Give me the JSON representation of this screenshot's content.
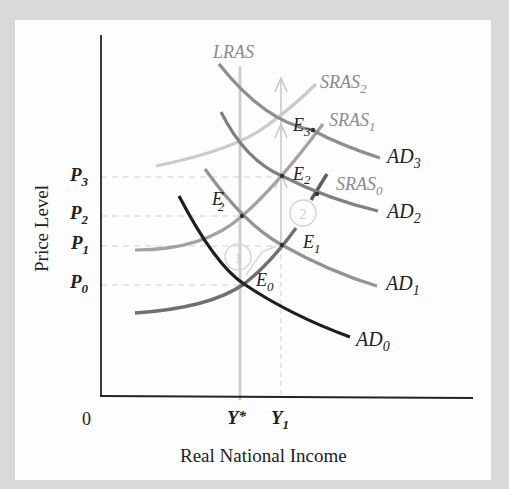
{
  "axes": {
    "y_title": "Price Level",
    "x_title": "Real National Income",
    "origin": "0"
  },
  "price_levels": [
    {
      "base": "P",
      "sub": "3"
    },
    {
      "base": "P",
      "sub": "2"
    },
    {
      "base": "P",
      "sub": "1"
    },
    {
      "base": "P",
      "sub": "0"
    }
  ],
  "income_levels": [
    {
      "base": "Y",
      "sub": "",
      "sup": "*"
    },
    {
      "base": "Y",
      "sub": "1",
      "sup": ""
    }
  ],
  "curves": {
    "lras": {
      "label": "LRAS",
      "color": "#c8c8c8"
    },
    "sras0": {
      "base": "SRAS",
      "sub": "0",
      "color": "#6e6e6e"
    },
    "sras1": {
      "base": "SRAS",
      "sub": "1",
      "color": "#9a9a9a"
    },
    "sras2": {
      "base": "SRAS",
      "sub": "2",
      "color": "#c4c4c4"
    },
    "ad0": {
      "base": "AD",
      "sub": "0",
      "color": "#1e1e1e"
    },
    "ad1": {
      "base": "AD",
      "sub": "1",
      "color": "#8c8c8c"
    },
    "ad2": {
      "base": "AD",
      "sub": "2",
      "color": "#7c7c7c"
    },
    "ad3": {
      "base": "AD",
      "sub": "3",
      "color": "#8a8a8a"
    }
  },
  "equilibria": [
    {
      "base": "E",
      "sub": "0",
      "prime": ""
    },
    {
      "base": "E",
      "sub": "1",
      "prime": ""
    },
    {
      "base": "E",
      "sub": "2",
      "prime": "'"
    },
    {
      "base": "E",
      "sub": "2",
      "prime": ""
    },
    {
      "base": "E",
      "sub": "3",
      "prime": ""
    }
  ],
  "steps": [
    "1",
    "2"
  ],
  "colors": {
    "background": "#d9d9d9",
    "panel": "#fdfdfd",
    "text": "#222222",
    "label_gray": "#8a8a8a",
    "guide": "#cccccc"
  }
}
